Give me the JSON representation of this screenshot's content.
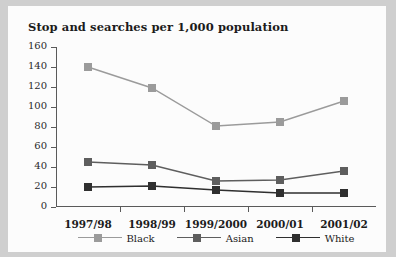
{
  "chart_data": {
    "type": "line",
    "title": "Stop and searches per 1,000 population",
    "xlabel": "",
    "ylabel": "",
    "ylim": [
      0,
      160
    ],
    "yticks": [
      0,
      20,
      40,
      60,
      80,
      100,
      120,
      140,
      160
    ],
    "ytick_labels": [
      "0",
      "20",
      "40",
      "60",
      "80",
      "100",
      "120",
      "140",
      "160"
    ],
    "grid": false,
    "legend_position": "bottom",
    "categories": [
      "1997/98",
      "1998/99",
      "1999/2000",
      "2000/01",
      "2001/02"
    ],
    "series": [
      {
        "name": "Black",
        "color": "#9b9b9b",
        "marker": "square",
        "values": [
          140,
          119,
          81,
          85,
          106
        ]
      },
      {
        "name": "Asian",
        "color": "#5e5e5e",
        "marker": "square",
        "values": [
          45,
          42,
          26,
          27,
          36
        ]
      },
      {
        "name": "White",
        "color": "#2f2f2f",
        "marker": "square",
        "values": [
          20,
          21,
          17,
          14,
          14
        ]
      }
    ]
  },
  "legend": {
    "entries": [
      {
        "label": "Black"
      },
      {
        "label": "Asian"
      },
      {
        "label": "White"
      }
    ]
  },
  "colors": {
    "page_background": "#cfcfcf",
    "paper": "#fcfcfc",
    "axis": "#5a5a5a",
    "text": "#1b1b1b"
  }
}
